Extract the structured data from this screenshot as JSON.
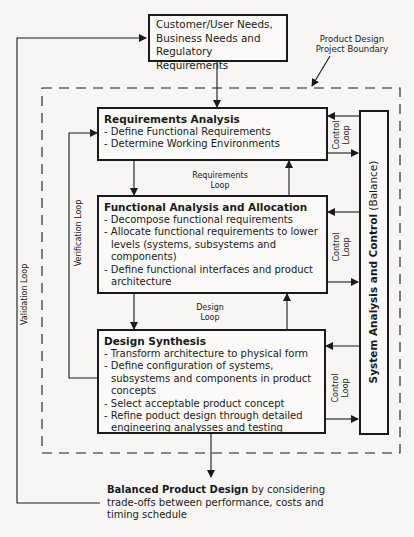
{
  "top_box": {
    "lines": [
      "Customer/User Needs,",
      "Business Needs and",
      "Regulatory Requirements"
    ]
  },
  "boundary_label": {
    "line1": "Product Design",
    "line2": "Project Boundary"
  },
  "requirements_analysis": {
    "title": "Requirements Analysis",
    "items": [
      "- Define Functional Requirements",
      "- Determine Working Environments"
    ]
  },
  "functional_analysis": {
    "title": "Functional Analysis and Allocation",
    "items": [
      "- Decompose functional requirements",
      "- Allocate functional requirements to lower levels (systems, subsystems and components)",
      "- Define functional interfaces and product architecture"
    ]
  },
  "design_synthesis": {
    "title": "Design Synthesis",
    "items": [
      "- Transform architecture to physical form",
      "- Define configuration of systems, subsystems and components in product concepts",
      "- Select acceptable product concept",
      "- Refine poduct design through detailed engineering analysses and testing"
    ]
  },
  "system_control": {
    "bold": "System Analysis and Control",
    "normal": " (Balance)"
  },
  "loops": {
    "requirements": {
      "line1": "Requirements",
      "line2": "Loop"
    },
    "design": {
      "line1": "Design",
      "line2": "Loop"
    },
    "control1": {
      "line1": "Control",
      "line2": "Loop"
    },
    "control2": {
      "line1": "Control",
      "line2": "Loop"
    },
    "control3": {
      "line1": "Control",
      "line2": "Loop"
    },
    "verification": "Verification Loop",
    "validation": "Validation Loop"
  },
  "output": {
    "bold": "Balanced Product Design",
    "rest1": " by considering",
    "line2": "trade-offs between performance, costs and",
    "line3": "timing schedule"
  }
}
